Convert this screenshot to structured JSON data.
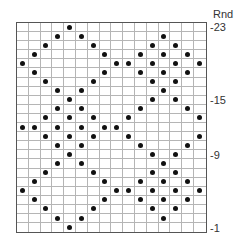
{
  "chart": {
    "header_label": "Rnd",
    "columns": 16,
    "rows": 23,
    "row_labels": [
      {
        "round": 23,
        "text": "-23"
      },
      {
        "round": 15,
        "text": "-15"
      },
      {
        "round": 9,
        "text": "-9"
      },
      {
        "round": 1,
        "text": "-1"
      }
    ],
    "dot_color": "#111111",
    "grid_color": "#b5b5b5",
    "rounds": {
      "23": [
        5
      ],
      "22": [
        4,
        6,
        13
      ],
      "21": [
        3,
        7,
        12,
        14
      ],
      "20": [
        2,
        8,
        11,
        13,
        15
      ],
      "19": [
        1,
        9,
        10,
        12,
        14,
        16
      ],
      "18": [
        2,
        8,
        11,
        13,
        15
      ],
      "17": [
        3,
        7,
        12,
        14
      ],
      "16": [
        4,
        6,
        13
      ],
      "15": [
        5,
        12,
        14
      ],
      "14": [
        4,
        6,
        11,
        15
      ],
      "13": [
        3,
        5,
        7,
        10,
        16
      ],
      "12": [
        1,
        2,
        4,
        6,
        8,
        9
      ],
      "11": [
        3,
        5,
        7,
        10,
        16
      ],
      "10": [
        4,
        6,
        11,
        15
      ],
      "9": [
        5,
        12,
        14
      ],
      "8": [
        4,
        6,
        13
      ],
      "7": [
        3,
        7,
        12,
        14
      ],
      "6": [
        2,
        8,
        11,
        13,
        15
      ],
      "5": [
        1,
        9,
        10,
        12,
        14,
        16
      ],
      "4": [
        2,
        8,
        11,
        13,
        15
      ],
      "3": [
        3,
        7,
        12,
        14
      ],
      "2": [
        4,
        6,
        13
      ],
      "1": [
        5
      ]
    }
  }
}
